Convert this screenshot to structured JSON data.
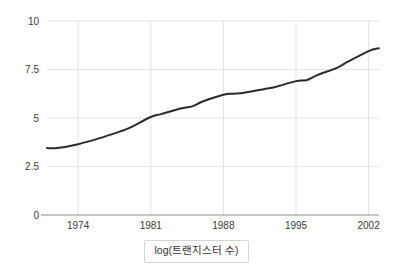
{
  "chart_data": {
    "type": "line",
    "title": "",
    "subtitle": "",
    "xlabel": "",
    "ylabel": "",
    "caption": "log(트랜지스터 수)",
    "grid": true,
    "legend": null,
    "legend_position": "none",
    "line_color": "#2b2b2b",
    "grid_color": "#e3e3e3",
    "axis_color": "#8c8c8c",
    "background_color": "#ffffff",
    "xlim": [
      1971,
      2003
    ],
    "ylim": [
      0,
      10
    ],
    "xticks": [
      1974,
      1981,
      1988,
      1995,
      2002
    ],
    "xtick_labels": [
      "1974",
      "1981",
      "1988",
      "1995",
      "2002"
    ],
    "yticks": [
      0,
      2.5,
      5,
      7.5,
      10
    ],
    "ytick_labels": [
      "0",
      "2.5",
      "5",
      "7.5",
      "10"
    ],
    "series": [
      {
        "name": "log(트랜지스터 수)",
        "x": [
          1971,
          1972,
          1974,
          1976,
          1978,
          1979,
          1981,
          1982,
          1984,
          1985,
          1986,
          1988,
          1989,
          1990,
          1992,
          1993,
          1995,
          1996,
          1997,
          1999,
          2000,
          2002,
          2003
        ],
        "values": [
          3.45,
          3.45,
          3.65,
          3.95,
          4.3,
          4.5,
          5.05,
          5.2,
          5.5,
          5.6,
          5.85,
          6.2,
          6.25,
          6.3,
          6.5,
          6.6,
          6.9,
          6.95,
          7.2,
          7.6,
          7.9,
          8.45,
          8.6
        ]
      }
    ]
  }
}
